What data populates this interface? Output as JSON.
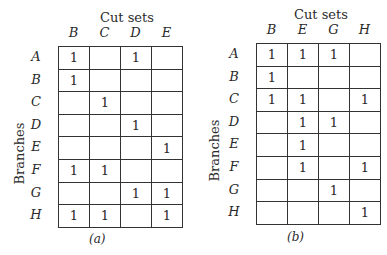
{
  "figures": [
    {
      "id": "a",
      "title": "Cut sets",
      "row_axis_label": "Branches",
      "columns": [
        "B",
        "C",
        "D",
        "E"
      ],
      "rows": [
        {
          "label": "A",
          "cells": [
            "1",
            "",
            "1",
            ""
          ]
        },
        {
          "label": "B",
          "cells": [
            "1",
            "",
            "",
            ""
          ]
        },
        {
          "label": "C",
          "cells": [
            "",
            "1",
            "",
            ""
          ]
        },
        {
          "label": "D",
          "cells": [
            "",
            "",
            "1",
            ""
          ]
        },
        {
          "label": "E",
          "cells": [
            "",
            "",
            "",
            "1"
          ]
        },
        {
          "label": "F",
          "cells": [
            "1",
            "1",
            "",
            ""
          ]
        },
        {
          "label": "G",
          "cells": [
            "",
            "",
            "1",
            "1"
          ]
        },
        {
          "label": "H",
          "cells": [
            "1",
            "1",
            "",
            "1"
          ]
        }
      ],
      "caption": "(a)"
    },
    {
      "id": "b",
      "title": "Cut sets",
      "row_axis_label": "Branches",
      "columns": [
        "B",
        "E",
        "G",
        "H"
      ],
      "rows": [
        {
          "label": "A",
          "cells": [
            "1",
            "1",
            "1",
            ""
          ]
        },
        {
          "label": "B",
          "cells": [
            "1",
            "",
            "",
            ""
          ]
        },
        {
          "label": "C",
          "cells": [
            "1",
            "1",
            "",
            "1"
          ]
        },
        {
          "label": "D",
          "cells": [
            "",
            "1",
            "1",
            ""
          ]
        },
        {
          "label": "E",
          "cells": [
            "",
            "1",
            "",
            ""
          ]
        },
        {
          "label": "F",
          "cells": [
            "",
            "1",
            "",
            "1"
          ]
        },
        {
          "label": "G",
          "cells": [
            "",
            "",
            "1",
            ""
          ]
        },
        {
          "label": "H",
          "cells": [
            "",
            "",
            "",
            "1"
          ]
        }
      ],
      "caption": "(b)"
    }
  ]
}
